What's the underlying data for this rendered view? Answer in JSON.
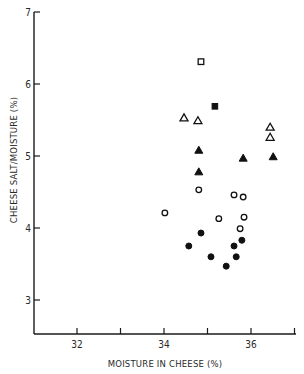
{
  "chart_data": {
    "type": "scatter",
    "title": "",
    "xlabel": "MOISTURE IN CHEESE (%)",
    "ylabel": "CHEESE SALT/MOISTURE (%)",
    "xlim": [
      31.0,
      37.0
    ],
    "ylim": [
      2.5,
      7.0
    ],
    "x_ticks": [
      32,
      33,
      34,
      35,
      36,
      37
    ],
    "x_tick_labels": [
      "32",
      "",
      "34",
      "",
      "36",
      ""
    ],
    "y_ticks": [
      3,
      4,
      5,
      6,
      7
    ],
    "y_tick_labels": [
      "3",
      "4",
      "5",
      "6",
      "7"
    ],
    "grid": false,
    "legend": null,
    "series": [
      {
        "name": "open square",
        "marker": "square",
        "filled": false,
        "points": [
          [
            34.85,
            6.31
          ]
        ]
      },
      {
        "name": "filled square",
        "marker": "square",
        "filled": true,
        "points": [
          [
            35.17,
            5.69
          ]
        ]
      },
      {
        "name": "open triangle",
        "marker": "triangle",
        "filled": false,
        "points": [
          [
            34.46,
            5.53
          ],
          [
            34.78,
            5.49
          ],
          [
            36.44,
            5.4
          ],
          [
            36.44,
            5.26
          ]
        ]
      },
      {
        "name": "filled triangle",
        "marker": "triangle",
        "filled": true,
        "points": [
          [
            34.8,
            5.08
          ],
          [
            35.82,
            4.97
          ],
          [
            36.51,
            4.99
          ],
          [
            34.8,
            4.78
          ]
        ]
      },
      {
        "name": "open circle",
        "marker": "circle",
        "filled": false,
        "points": [
          [
            34.8,
            4.53
          ],
          [
            34.02,
            4.21
          ],
          [
            35.61,
            4.46
          ],
          [
            35.82,
            4.43
          ],
          [
            35.26,
            4.13
          ],
          [
            35.84,
            4.15
          ],
          [
            35.75,
            3.99
          ]
        ]
      },
      {
        "name": "filled circle",
        "marker": "circle",
        "filled": true,
        "points": [
          [
            34.85,
            3.93
          ],
          [
            34.57,
            3.75
          ],
          [
            35.08,
            3.6
          ],
          [
            35.61,
            3.75
          ],
          [
            35.79,
            3.83
          ],
          [
            35.66,
            3.6
          ],
          [
            35.43,
            3.47
          ]
        ]
      }
    ]
  }
}
